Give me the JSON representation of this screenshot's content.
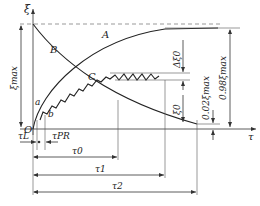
{
  "diagram": {
    "axes": {
      "y_label": "ξ",
      "x_label": "τ",
      "origin_label": "O"
    },
    "curves": [
      {
        "id": "A",
        "label": "A"
      },
      {
        "id": "B",
        "label": "B"
      },
      {
        "id": "C",
        "label": "C"
      }
    ],
    "points": {
      "a": "a",
      "b": "b"
    },
    "vertical_dims": {
      "xi_max": "ξmax",
      "delta_xi0": "Δξ0",
      "xi0": "ξ0",
      "small": "0.02ξmax",
      "large": "0.98ξmax"
    },
    "horizontal_dims": {
      "tau_l": "τL",
      "tau_pr": "τPR",
      "tau0": "τ0",
      "tau1": "τ1",
      "tau2": "τ2"
    },
    "colors": {
      "line": "#333333",
      "background": "#ffffff"
    }
  }
}
